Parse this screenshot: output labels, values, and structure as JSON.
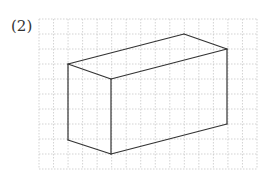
{
  "label": "(2)",
  "grid": {
    "x0": 39,
    "y0": 19,
    "x1": 257,
    "y1": 169,
    "cols": 15,
    "rows": 10,
    "color": "#c8c8c8"
  },
  "figure": {
    "type": "rectangular-prism-oblique",
    "stroke": "#333333",
    "vertices": {
      "A": [
        68,
        64
      ],
      "B": [
        184,
        34
      ],
      "C": [
        227,
        49
      ],
      "D": [
        111,
        79
      ],
      "E": [
        68,
        140
      ],
      "F": [
        111,
        154
      ],
      "G": [
        227,
        124
      ]
    },
    "edges": [
      [
        "A",
        "B"
      ],
      [
        "B",
        "C"
      ],
      [
        "C",
        "D"
      ],
      [
        "D",
        "A"
      ],
      [
        "A",
        "E"
      ],
      [
        "D",
        "F"
      ],
      [
        "C",
        "G"
      ],
      [
        "E",
        "F"
      ],
      [
        "F",
        "G"
      ]
    ]
  }
}
